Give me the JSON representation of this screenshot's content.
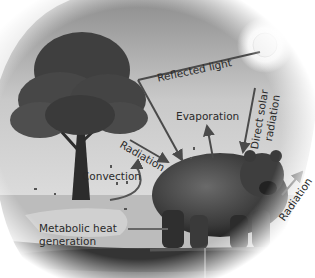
{
  "labels": {
    "reflected_light": "Reflected light",
    "direct_solar_radiation_line1": "Direct solar",
    "direct_solar_radiation_line2": "radiation",
    "evaporation": "Evaporation",
    "radiation_left": "Radiation",
    "convection": "Convection",
    "radiation_right": "Radiation",
    "metabolic_heat_line1": "Metabolic heat",
    "metabolic_heat_line2": "generation"
  },
  "elements": {
    "sun": "sun",
    "tree": "tree",
    "bear": "bear",
    "ground": "ground"
  },
  "colors": {
    "sky": "#9a9a9a",
    "ground": "#6b6b6b",
    "tree_foliage": "#3f3f3f",
    "bear": "#3a3a3a",
    "arrow": "#4a4a4a",
    "text": "#2a2a2a"
  }
}
